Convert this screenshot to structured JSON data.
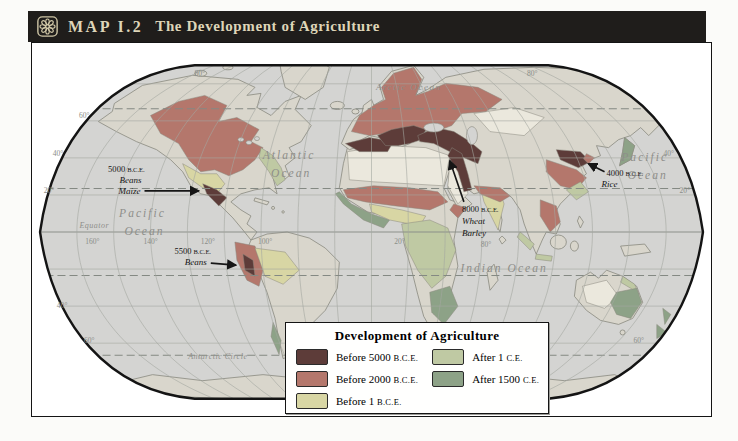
{
  "colors": {
    "ocean": "#d4d4d2",
    "land": "#d9d6cc",
    "desert": "#ebe8dd",
    "header_bar": "#1f1d1b",
    "header_text": "#ded5b8"
  },
  "header": {
    "map_label": "MAP I.2",
    "title": "The Development of Agriculture"
  },
  "legend": {
    "title": "Development of Agriculture",
    "items": [
      {
        "label": "Before 5000",
        "era": "B.C.E.",
        "color": "#5d3c39"
      },
      {
        "label": "Before 2000",
        "era": "B.C.E.",
        "color": "#b4776c"
      },
      {
        "label": "Before 1",
        "era": "B.C.E.",
        "color": "#d8d6a4"
      },
      {
        "label": "After 1",
        "era": "C.E.",
        "color": "#bfc9a3"
      },
      {
        "label": "After 1500",
        "era": "C.E.",
        "color": "#8da287"
      }
    ]
  },
  "oceans": {
    "arctic": "Arctic Ocean",
    "atlantic_1": "Atlantic",
    "atlantic_2": "Ocean",
    "pacific_w_1": "Pacific",
    "pacific_w_2": "Ocean",
    "pacific_e_1": "Pacific",
    "pacific_e_2": "Ocean",
    "indian": "Indian Ocean",
    "equator": "Equator",
    "antarctic_circle": "Antarctic Circle"
  },
  "annotations": [
    {
      "year": "5000",
      "era": "B.C.E.",
      "crop_1": "Beans",
      "crop_2": "Maize"
    },
    {
      "year": "5500",
      "era": "B.C.E.",
      "crop_1": "Beans"
    },
    {
      "year": "8000",
      "era": "B.C.E.",
      "crop_1": "Wheat",
      "crop_2": "Barley"
    },
    {
      "year": "4000",
      "era": "B.C.E.",
      "crop_1": "Rice"
    }
  ],
  "grid_labels": [
    "80°",
    "80°",
    "60°",
    "40°",
    "20°",
    "40°",
    "20°",
    "40°",
    "60°",
    "60°",
    "160°",
    "140°",
    "120°",
    "100°",
    "20°",
    "80°"
  ]
}
